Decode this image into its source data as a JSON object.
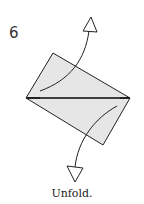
{
  "step": {
    "number": "6",
    "caption": "Unfold."
  },
  "colors": {
    "paper": "#e6e6e6",
    "line": "#222222",
    "background": "#ffffff"
  },
  "diagram": {
    "shape": "rectangle-folded-diagonally",
    "vertices": {
      "left": [
        26,
        98
      ],
      "top": [
        53,
        53
      ],
      "right": [
        130,
        98
      ],
      "bottom": [
        103,
        145
      ]
    },
    "arrows": [
      {
        "name": "unfold-arrow-up",
        "direction": "up"
      },
      {
        "name": "unfold-arrow-down",
        "direction": "down"
      }
    ]
  }
}
